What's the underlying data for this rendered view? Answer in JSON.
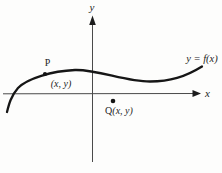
{
  "figure": {
    "background_color": "#fdfdfc",
    "ink_color": "#161616",
    "axis_color": "#4a4a4a",
    "labels": {
      "y_axis": "y",
      "x_axis": "x",
      "curve_equation": "y = f(x)",
      "point_p": "P",
      "point_p_coords": "(x, y)",
      "point_q_name": "Q",
      "point_q_coords": "(x, y)"
    },
    "geometry": {
      "curve_path": "M 7 112 C 9 104 11 96 18 88 C 27 78.5 52 71 75 70 C 98 69.3 125 81.5 150 81.5 C 170 81.5 185 77 202 66.5",
      "p_dot": {
        "x": 45,
        "y": 74
      },
      "q_dot": {
        "x": 113,
        "y": 101
      }
    }
  }
}
